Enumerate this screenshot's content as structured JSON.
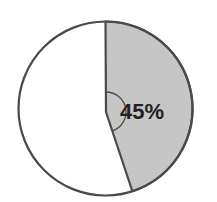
{
  "chart_data": {
    "type": "pie",
    "title": "",
    "slices": [
      {
        "label": "45%",
        "value": 45,
        "color": "#c6c6c6",
        "highlighted": true
      },
      {
        "label": "",
        "value": 55,
        "color": "#ffffff",
        "highlighted": false
      }
    ],
    "start_angle_deg": 0,
    "direction": "clockwise",
    "annotations": [
      {
        "type": "angle-arc",
        "text": "45%"
      }
    ],
    "legend": null
  },
  "colors": {
    "stroke": "#4a4a4a",
    "highlight_fill": "#c6c6c6",
    "background": "#ffffff"
  },
  "labels": {
    "slice_percent": "45%"
  }
}
